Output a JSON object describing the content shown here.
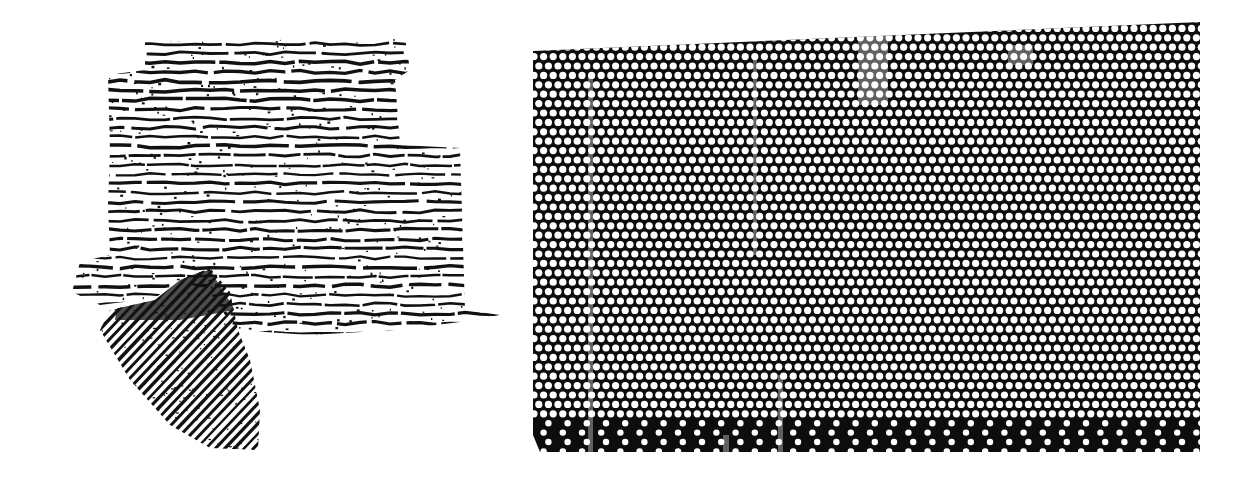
{
  "figures": [
    {
      "id": "left",
      "description": "Textile fragment impression with horizontal ribbing and a diagonally ribbed lower-left lobe",
      "colors": {
        "ink": "#111111",
        "paper": "#ffffff"
      }
    },
    {
      "id": "right",
      "description": "Hexagonal perforated dot pattern, white dots on black; bottom rows sparser and darker",
      "colors": {
        "ink": "#0d0d0d",
        "dot": "#ffffff"
      },
      "dot_pitch_x": 9.6,
      "dot_pitch_y": 9.4,
      "dot_radius": 3.6
    }
  ]
}
